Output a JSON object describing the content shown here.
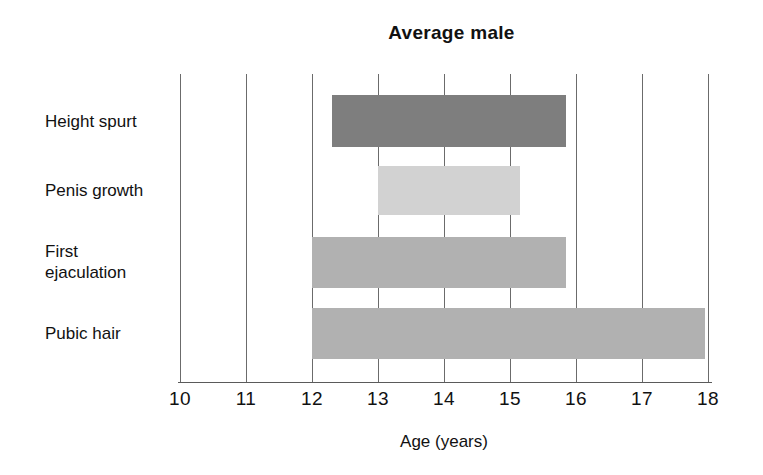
{
  "chart_data": {
    "type": "bar",
    "orientation": "horizontal",
    "title": "Average male",
    "xlabel": "Age (years)",
    "ylabel": "",
    "xlim": [
      10,
      18
    ],
    "xticks": [
      "10",
      "11",
      "12",
      "13",
      "14",
      "15",
      "16",
      "17",
      "18"
    ],
    "grid": "vertical",
    "legend": "none",
    "categories": [
      "Height spurt",
      "Penis growth",
      "First\nejaculation",
      "Pubic hair"
    ],
    "bars": [
      {
        "label": "Height spurt",
        "start": 12.3,
        "end": 15.85,
        "color": "#7e7e7e"
      },
      {
        "label": "Penis growth",
        "start": 13.0,
        "end": 15.15,
        "color": "#d2d2d2"
      },
      {
        "label": "First ejaculation",
        "start": 12.0,
        "end": 15.85,
        "color": "#b1b1b1"
      },
      {
        "label": "Pubic hair",
        "start": 12.0,
        "end": 17.95,
        "color": "#b1b1b1"
      }
    ]
  },
  "axis": {
    "tick_10": "10",
    "tick_11": "11",
    "tick_12": "12",
    "tick_13": "13",
    "tick_14": "14",
    "tick_15": "15",
    "tick_16": "16",
    "tick_17": "17",
    "tick_18": "18"
  },
  "labels": {
    "cat_0": "Height spurt",
    "cat_1": "Penis growth",
    "cat_2": "First\nejaculation",
    "cat_3": "Pubic hair"
  },
  "colors": {
    "gridline": "#6b6b6b",
    "axis": "#5a5a5a",
    "text": "#111111",
    "background": "#ffffff"
  }
}
